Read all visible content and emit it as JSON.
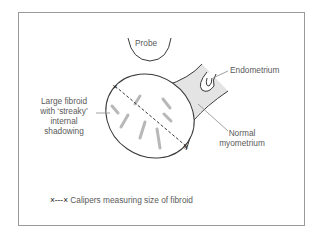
{
  "labels": {
    "probe": "Probe",
    "endometrium": "Endometrium",
    "fibroid_line1": "Large fibroid",
    "fibroid_line2": "with ‘streaky’",
    "fibroid_line3": "internal",
    "fibroid_line4": "shadowing",
    "myometrium_line1": "Normal",
    "myometrium_line2": "myometrium"
  },
  "legend": {
    "symbol": "×---×",
    "text": "Calipers measuring size of fibroid"
  },
  "colors": {
    "line": "#3a3a3a",
    "myometrium_fill": "#e4e4e4",
    "streak": "#b8b8b8",
    "leader": "#8a8a8a",
    "frame": "#9a9a9a"
  }
}
